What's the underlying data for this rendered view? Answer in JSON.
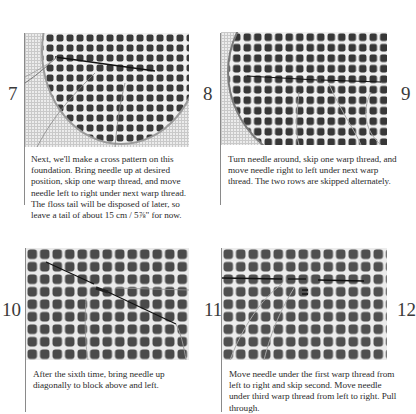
{
  "steps": [
    {
      "number": "7",
      "caption": "Next, we'll make a cross pattern on this foundation. Bring needle up at desired position, skip one warp thread, and move needle left to right under next warp thread. The floss tail will be disposed of later, so leave a tail of about 15 cm / 5⅞\" for now.",
      "photo_description": "Circular woven grid on mesh canvas with floss thread and needle along a row"
    },
    {
      "number": "8",
      "caption": "Turn needle around, skip one warp thread, and move needle right to left under next warp thread. The two rows are skipped alternately.",
      "photo_description": "Close-up of woven grid with dark floss line across one row"
    },
    {
      "number": "9",
      "caption": "",
      "photo_description": ""
    },
    {
      "number": "10",
      "caption": "After the sixth time, bring needle up diagonally to block above and left.",
      "photo_description": "Woven grid with needle moving diagonally"
    },
    {
      "number": "11",
      "caption": "Move needle under the first warp thread from left to right and skip second. Move needle under third warp thread from left to right. Pull through.",
      "photo_description": "Woven grid with floss crossing a row and small cross stitch"
    },
    {
      "number": "12",
      "caption": "",
      "photo_description": ""
    }
  ],
  "colors": {
    "background": "#ffffff",
    "text": "#2b2b2b",
    "rule": "#8a8a8a",
    "grid_dark": "#3c3c3c",
    "grid_light": "#e9e9e9"
  }
}
